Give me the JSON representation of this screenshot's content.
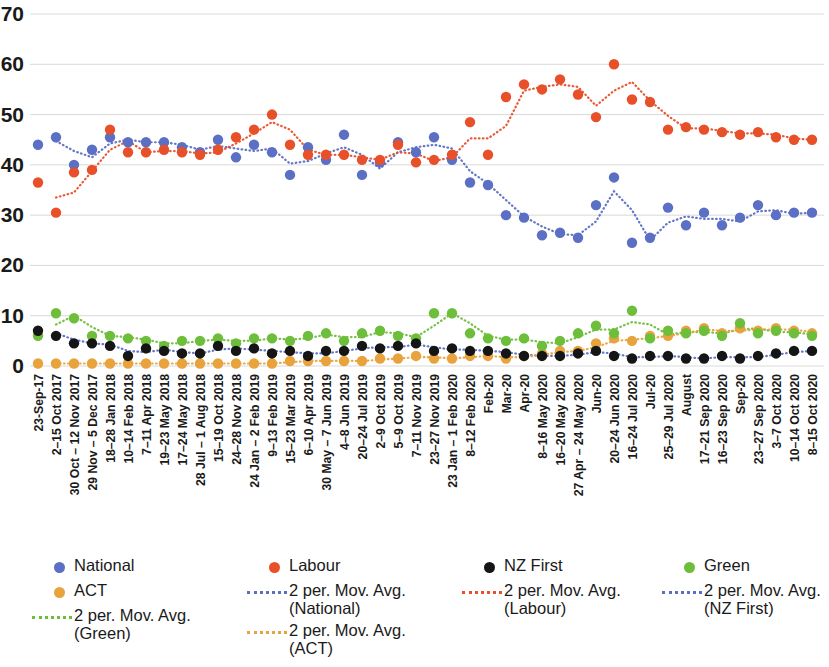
{
  "chart_data": {
    "type": "scatter",
    "title": "",
    "subtitle": "",
    "xlabel": "",
    "ylabel": "",
    "ylim": [
      0,
      70
    ],
    "yticks": [
      0,
      10,
      20,
      30,
      40,
      50,
      60,
      70
    ],
    "grid": true,
    "legend_position": "bottom",
    "categories": [
      "23-Sep-17",
      "2–15 Oct 2017",
      "30 Oct – 12 Nov 2017",
      "29 Nov – 5 Dec 2017",
      "18–28 Jan 2018",
      "10–14 Feb 2018",
      "7–11 Apr 2018",
      "19–23 May 2018",
      "17–24 May 2018",
      "28 Jul – 1 Aug 2018",
      "15–19 Oct 2018",
      "24–28 Nov 2018",
      "24 Jan – 2 Feb 2019",
      "9–13 Feb 2019",
      "15–23 Mar 2019",
      "6–10 Apr 2019",
      "30 May – 7 Jun 2019",
      "4–8 Jun 2019",
      "20–24 Jul 2019",
      "2–9 Oct 2019",
      "5–9 Oct 2019",
      "7–11 Nov 2019",
      "23–27 Nov 2019",
      "23 Jan – 1 Feb 2020",
      "8–12 Feb 2020",
      "Feb-20",
      "Mar-20",
      "Apr-20",
      "8–16 May 2020",
      "16–20 May 2020",
      "27 Apr – 24 May 2020",
      "Jun-20",
      "20–24 Jun 2020",
      "16–24 Jul 2020",
      "Jul-20",
      "25–29 Jul 2020",
      "August",
      "17–21 Sep 2020",
      "16–23 Sep 2020",
      "Sep-20",
      "23–27 Sep 2020",
      "3–7 Oct 2020",
      "10–14 Oct 2020",
      "8–15 Oct 2020"
    ],
    "series": [
      {
        "name": "National",
        "color": "#5B6FC4",
        "kind": "marker",
        "values": [
          44.0,
          45.5,
          40.0,
          43.0,
          45.5,
          44.5,
          44.5,
          44.5,
          43.5,
          42.5,
          45.0,
          41.5,
          44.0,
          42.5,
          38.0,
          43.5,
          41.0,
          46.0,
          38.0,
          40.5,
          44.5,
          42.5,
          45.5,
          41.0,
          36.5,
          36.0,
          30.0,
          29.5,
          26.0,
          26.5,
          25.5,
          32.0,
          37.5,
          24.5,
          25.5,
          31.5,
          28.0,
          30.5,
          28.0,
          29.5,
          32.0,
          30.0,
          30.5,
          30.5
        ]
      },
      {
        "name": "Labour",
        "color": "#E8502A",
        "kind": "marker",
        "values": [
          36.5,
          30.5,
          38.5,
          39.0,
          47.0,
          42.5,
          42.5,
          43.0,
          42.5,
          42.0,
          43.0,
          45.5,
          47.0,
          50.0,
          44.0,
          42.0,
          42.0,
          42.0,
          41.0,
          41.0,
          44.0,
          40.5,
          41.0,
          42.0,
          48.5,
          42.0,
          53.5,
          56.0,
          55.0,
          57.0,
          54.0,
          49.5,
          60.0,
          53.0,
          52.5,
          47.0,
          47.5,
          47.0,
          46.5,
          46.0,
          46.5,
          45.5,
          45.0,
          45.0
        ]
      },
      {
        "name": "NZ First",
        "color": "#151515",
        "kind": "marker",
        "values": [
          7.0,
          6.0,
          4.5,
          4.5,
          4.0,
          2.0,
          3.5,
          3.0,
          2.5,
          2.5,
          4.0,
          3.0,
          3.5,
          2.5,
          3.0,
          2.0,
          3.0,
          3.0,
          4.0,
          3.5,
          4.0,
          4.5,
          3.0,
          3.5,
          3.0,
          3.0,
          2.5,
          2.0,
          2.0,
          2.0,
          2.5,
          3.0,
          2.0,
          1.5,
          2.0,
          2.0,
          1.5,
          1.5,
          2.0,
          1.5,
          2.0,
          2.5,
          3.0,
          3.0
        ]
      },
      {
        "name": "Green",
        "color": "#6DBE3B",
        "kind": "marker",
        "values": [
          6.0,
          10.5,
          9.5,
          6.0,
          6.0,
          5.5,
          5.0,
          4.0,
          5.0,
          5.0,
          5.5,
          4.5,
          5.5,
          5.5,
          5.0,
          6.0,
          6.5,
          5.0,
          6.5,
          7.0,
          6.0,
          5.5,
          10.5,
          10.5,
          6.5,
          5.5,
          5.0,
          5.5,
          4.0,
          5.0,
          6.5,
          8.0,
          6.5,
          11.0,
          5.5,
          7.0,
          6.5,
          7.0,
          6.0,
          8.5,
          6.5,
          7.0,
          6.5,
          6.0
        ]
      },
      {
        "name": "ACT",
        "color": "#E8A33D",
        "kind": "marker",
        "values": [
          0.5,
          0.5,
          0.5,
          0.5,
          0.5,
          0.5,
          0.5,
          0.5,
          0.5,
          0.5,
          0.5,
          0.5,
          0.5,
          0.5,
          1.0,
          1.0,
          1.0,
          1.0,
          1.0,
          1.5,
          1.5,
          2.0,
          1.5,
          1.5,
          2.0,
          2.0,
          1.5,
          2.0,
          2.5,
          3.0,
          3.0,
          4.5,
          5.5,
          5.0,
          6.0,
          6.0,
          7.0,
          7.5,
          6.5,
          7.5,
          7.0,
          7.5,
          7.0,
          6.5
        ]
      },
      {
        "name": "2 per. Mov. Avg. (National)",
        "color": "#5B6FC4",
        "kind": "trend",
        "of": "National"
      },
      {
        "name": "2 per. Mov. Avg. (Labour)",
        "color": "#E8502A",
        "kind": "trend",
        "of": "Labour"
      },
      {
        "name": "2 per. Mov. Avg. (NZ First)",
        "color": "#5B6FC4",
        "kind": "trend",
        "of": "NZ First"
      },
      {
        "name": "2 per. Mov. Avg. (Green)",
        "color": "#6DBE3B",
        "kind": "trend",
        "of": "Green"
      },
      {
        "name": "2 per. Mov. Avg. (ACT)",
        "color": "#E8A33D",
        "kind": "trend",
        "of": "ACT"
      }
    ]
  },
  "legend": {
    "columns": [
      {
        "left": 30,
        "items": [
          {
            "label": "National",
            "mark": "dot",
            "color": "#5B6FC4"
          },
          {
            "label": "ACT",
            "mark": "dot",
            "color": "#E8A33D"
          },
          {
            "label": "2 per. Mov. Avg.\n(Green)",
            "mark": "line",
            "color": "#6DBE3B"
          }
        ]
      },
      {
        "left": 245,
        "items": [
          {
            "label": "Labour",
            "mark": "dot",
            "color": "#E8502A"
          },
          {
            "label": "2 per. Mov. Avg.\n(National)",
            "mark": "line",
            "color": "#5B6FC4"
          },
          {
            "label": "2 per. Mov. Avg.\n(ACT)",
            "mark": "line",
            "color": "#E8A33D"
          }
        ]
      },
      {
        "left": 460,
        "items": [
          {
            "label": "NZ First",
            "mark": "dot",
            "color": "#151515"
          },
          {
            "label": "2 per. Mov. Avg.\n(Labour)",
            "mark": "line",
            "color": "#E8502A"
          }
        ]
      },
      {
        "left": 660,
        "items": [
          {
            "label": "Green",
            "mark": "dot",
            "color": "#6DBE3B"
          },
          {
            "label": "2 per. Mov. Avg.\n(NZ First)",
            "mark": "line",
            "color": "#5B6FC4"
          }
        ]
      }
    ]
  }
}
